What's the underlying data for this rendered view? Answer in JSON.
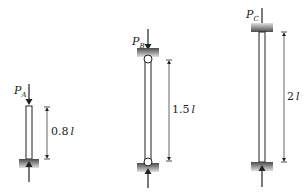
{
  "columns": [
    {
      "id": "A",
      "load_label": "P",
      "load_subscript": "A",
      "length_label_number": "0.8",
      "length_label_unit": "l",
      "support_top": "free",
      "support_bottom": "fixed"
    },
    {
      "id": "B",
      "load_label": "P",
      "load_subscript": "B",
      "length_label_number": "1.5",
      "length_label_unit": "l",
      "support_top": "pinned",
      "support_bottom": "pinned"
    },
    {
      "id": "C",
      "load_label": "P",
      "load_subscript": "C",
      "length_label_number": "2",
      "length_label_unit": "l",
      "support_top": "fixed",
      "support_bottom": "fixed"
    }
  ],
  "colors": {
    "line": "#222222",
    "support_dark": "#555555",
    "support_light": "#d8d8d8",
    "background": "#ffffff"
  }
}
